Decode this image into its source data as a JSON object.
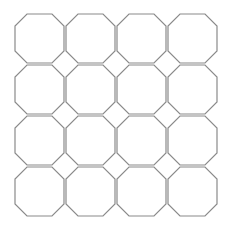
{
  "diagram": {
    "type": "octagon-tiling",
    "rows": 4,
    "columns": 4,
    "origin": [
      15,
      14
    ],
    "cell_pitch": 51,
    "octagon_size": 49,
    "corner_cut": 12,
    "colors": {
      "stroke": "#8a8a8a",
      "fill": "#ffffff",
      "background": "#ffffff"
    }
  }
}
